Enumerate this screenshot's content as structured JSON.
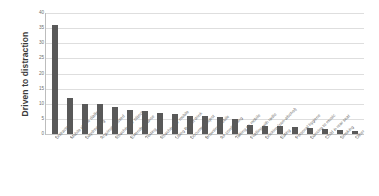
{
  "chart_data": {
    "type": "bar",
    "title": "",
    "subtitle": "",
    "xlabel": "",
    "ylabel": "Driven to distraction",
    "ylim": [
      0,
      40
    ],
    "ytick_values": [
      0,
      5,
      10,
      15,
      20,
      25,
      30,
      35,
      40
    ],
    "ytick_labels": [
      "0",
      "5",
      "10",
      "15",
      "20",
      "25",
      "30",
      "35",
      "40"
    ],
    "grid": true,
    "legend": false,
    "legend_position": "none",
    "bar_color": "#595959",
    "gridline_color": "#dedede",
    "categories": [
      "Distracted",
      "Mobile phone dialling",
      "Daydreaming",
      "Arguing/stressed",
      "Reaching for object",
      "Extended glance",
      "Texting",
      "Reaching for mobile",
      "Using the hot drink",
      "Document/object",
      "Browsing mobile",
      "Air conditioning",
      "Talking on mobile",
      "Fiddling with radio",
      "Drinking (non-alcohol)",
      "Eating",
      "Personal hygiene",
      "Dancing to music",
      "Child in rear seat",
      "Smoking",
      "Other"
    ],
    "values": [
      36,
      12,
      10,
      9.8,
      9,
      8,
      7.5,
      7,
      6.5,
      6,
      5.8,
      5.5,
      5,
      3,
      2.8,
      2.5,
      2.2,
      2,
      1.8,
      1.2,
      1
    ]
  }
}
